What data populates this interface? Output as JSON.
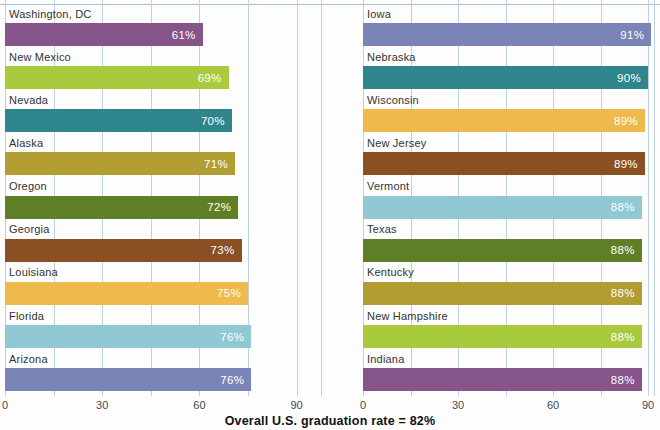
{
  "chart_data": {
    "type": "bar",
    "orientation": "horizontal",
    "title": "",
    "xlabel": "",
    "ylabel": "",
    "x_ticks": [
      0,
      30,
      60,
      90
    ],
    "gridline_step": 15,
    "xlim": [
      0,
      90
    ],
    "grid": true,
    "value_label_format": "{value}%",
    "panels": [
      {
        "name": "lowest-graduation-rate-states",
        "categories": [
          "Washington, DC",
          "New Mexico",
          "Nevada",
          "Alaska",
          "Oregon",
          "Georgia",
          "Louisiana",
          "Florida",
          "Arizona"
        ],
        "values": [
          61,
          69,
          70,
          71,
          72,
          73,
          75,
          76,
          76
        ],
        "value_labels": [
          "61%",
          "69%",
          "70%",
          "71%",
          "72%",
          "73%",
          "75%",
          "76%",
          "76%"
        ],
        "colors": [
          "#84548a",
          "#a8ca3c",
          "#2f858c",
          "#b29d33",
          "#5f7f27",
          "#8a4f22",
          "#eeba4b",
          "#90c9d3",
          "#7b84b7"
        ]
      },
      {
        "name": "highest-graduation-rate-states",
        "categories": [
          "Iowa",
          "Nebraska",
          "Wisconsin",
          "New Jersey",
          "Vermont",
          "Texas",
          "Kentucky",
          "New Hampshire",
          "Indiana"
        ],
        "values": [
          91,
          90,
          89,
          89,
          88,
          88,
          88,
          88,
          88
        ],
        "value_labels": [
          "91%",
          "90%",
          "89%",
          "89%",
          "88%",
          "88%",
          "88%",
          "88%",
          "88%"
        ],
        "colors": [
          "#7b84b7",
          "#2f858c",
          "#eeba4b",
          "#8a4f22",
          "#90c9d3",
          "#5f7f27",
          "#b29d33",
          "#a8ca3c",
          "#84548a"
        ]
      }
    ],
    "caption": {
      "prefix": "Overall U.S. graduation rate = ",
      "value": "82%"
    }
  },
  "colors": {
    "gridline": "#bdd3e2",
    "top_border": "#a9bfd2",
    "label_text": "#333333",
    "axis_text": "#4a4a4a",
    "value_text": "#ffffff",
    "background": "#fdfdfe"
  }
}
